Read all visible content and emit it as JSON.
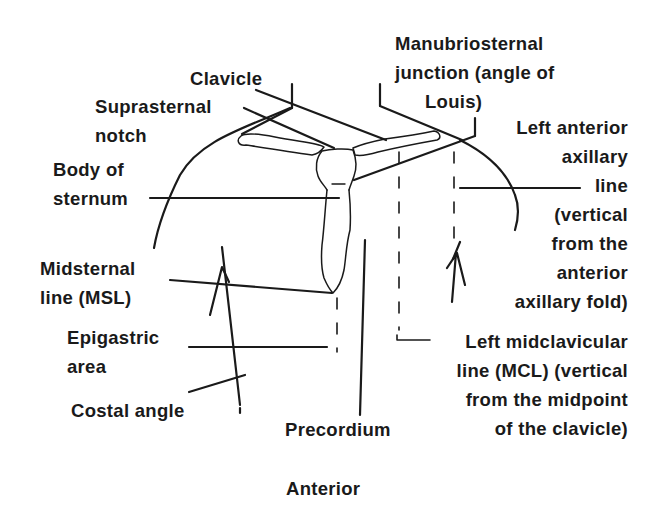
{
  "diagram": {
    "view": "Anterior",
    "labels": {
      "clavicle": [
        "Clavicle"
      ],
      "suprasternal_notch": [
        "Suprasternal",
        "notch"
      ],
      "manubriosternal_junction": [
        "Manubriosternal",
        "junction (angle of",
        "Louis)"
      ],
      "left_anterior_axillary_line": [
        "Left anterior",
        "axillary",
        "line",
        "(vertical",
        "from the",
        "anterior",
        "axillary fold)"
      ],
      "body_of_sternum": [
        "Body of",
        "sternum"
      ],
      "midsternal_line": [
        "Midsternal",
        "line (MSL)"
      ],
      "epigastric_area": [
        "Epigastric",
        "area"
      ],
      "costal_angle": [
        "Costal angle"
      ],
      "precordium": [
        "Precordium"
      ],
      "left_midclavicular_line": [
        "Left midclavicular",
        "line (MCL) (vertical",
        "from the midpoint",
        "of the clavicle)"
      ],
      "caption": "Anterior"
    },
    "colors": {
      "ink": "#1a1a1a",
      "background": "#ffffff"
    }
  }
}
